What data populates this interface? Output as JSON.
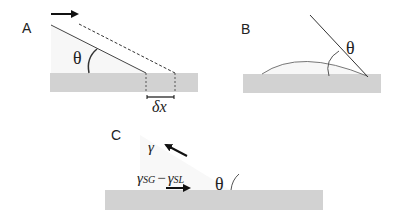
{
  "panels": {
    "A": {
      "label": "A",
      "angle_label": "θ",
      "displacement_label": "δx",
      "arrow": "motion-right"
    },
    "B": {
      "label": "B",
      "angle_label": "θ"
    },
    "C": {
      "label": "C",
      "angle_label": "θ",
      "gamma_label": "γ",
      "gamma_sg": "γ",
      "gamma_sg_sub": "SG",
      "minus": "−",
      "gamma_sl": "γ",
      "gamma_sl_sub": "SL"
    }
  },
  "colors": {
    "substrate": "#d2d2d2",
    "line": "#3a3a3a",
    "text": "#222222",
    "liquid_fill": "#f6f6f6"
  }
}
